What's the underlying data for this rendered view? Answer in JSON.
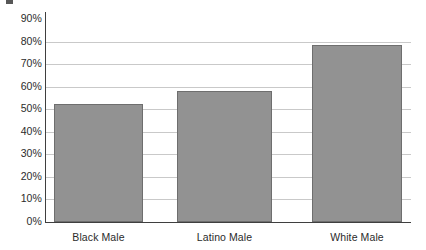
{
  "chart_data": {
    "type": "bar",
    "title": "",
    "xlabel": "",
    "ylabel": "",
    "categories": [
      "Black Male",
      "Latino Male",
      "White Male"
    ],
    "values": [
      52.5,
      58,
      78.5
    ],
    "ylim": [
      0,
      90
    ],
    "ytick_labels": [
      "0%",
      "10%",
      "20%",
      "30%",
      "40%",
      "50%",
      "60%",
      "70%",
      "80%",
      "90%"
    ],
    "ytick_values": [
      0,
      10,
      20,
      30,
      40,
      50,
      60,
      70,
      80,
      90
    ],
    "grid": true,
    "gridline_values": [
      0,
      10,
      20,
      30,
      40,
      50,
      60,
      70,
      80
    ],
    "legend": null,
    "bar_color": "#929292",
    "bar_border_color": "#6e6e6e",
    "gridline_color": "#c9c9c9",
    "axis_color": "#3f3f3f",
    "text_color": "#2b2b2b"
  },
  "artifact": {
    "top_crop_mark": ""
  }
}
